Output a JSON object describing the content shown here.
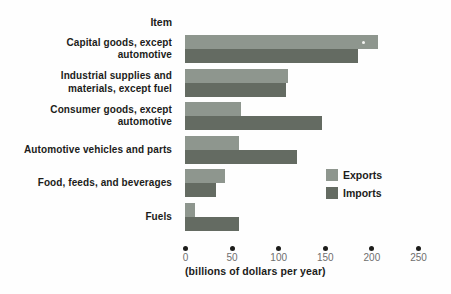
{
  "colors": {
    "background": "#fefefe",
    "exports_bar": "#8e968e",
    "imports_bar": "#646b62",
    "axis_dot": "#1d1d1b",
    "tick_label": "#6e6e6e",
    "label_text": "#1c1c1a"
  },
  "chart_data": {
    "type": "bar",
    "orientation": "horizontal",
    "column_header": "Item",
    "categories": [
      {
        "label": "Capital goods, except automotive",
        "lines": [
          "Capital goods, except",
          "automotive"
        ]
      },
      {
        "label": "Industrial supplies and materials, except fuel",
        "lines": [
          "Industrial supplies and",
          "materials, except fuel"
        ]
      },
      {
        "label": "Consumer goods, except automotive",
        "lines": [
          "Consumer goods, except",
          "automotive"
        ]
      },
      {
        "label": "Automotive vehicles and parts",
        "lines": [
          "Automotive vehicles and parts"
        ]
      },
      {
        "label": "Food, feeds, and beverages",
        "lines": [
          "Food, feeds, and beverages"
        ]
      },
      {
        "label": "Fuels",
        "lines": [
          "Fuels"
        ]
      }
    ],
    "series": [
      {
        "name": "Exports",
        "color_key": "exports",
        "values": [
          207,
          110,
          60,
          58,
          43,
          11
        ]
      },
      {
        "name": "Imports",
        "color_key": "imports",
        "values": [
          186,
          108,
          147,
          120,
          33,
          58
        ]
      }
    ],
    "x_ticks": [
      0,
      50,
      100,
      150,
      200,
      250
    ],
    "xlim": [
      0,
      250
    ],
    "xlabel": "(billions of dollars per year)",
    "ylabel": "",
    "title": "",
    "grid": false,
    "legend_position": "right-middle"
  }
}
